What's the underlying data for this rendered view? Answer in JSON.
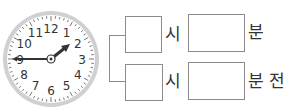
{
  "clock": {
    "numbers": [
      "12",
      "1",
      "2",
      "3",
      "4",
      "5",
      "6",
      "7",
      "8",
      "9",
      "10",
      "11"
    ],
    "hour_hand_target": "2",
    "minute_hand_target": "9",
    "ring_color": "#c8c8c8",
    "hand_color": "#333333"
  },
  "answers": {
    "row1": {
      "hour_value": "",
      "hour_unit": "시",
      "minute_value": "",
      "minute_unit": "분"
    },
    "row2": {
      "hour_value": "",
      "hour_unit": "시",
      "minute_value": "",
      "minute_unit": "분 전"
    }
  }
}
